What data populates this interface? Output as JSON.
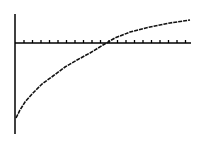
{
  "chart_data": {
    "type": "line",
    "title": "",
    "xlabel": "",
    "ylabel": "",
    "grid": false,
    "legend": null,
    "x_tick_count": 20,
    "series": [
      {
        "name": "curve",
        "points_px": [
          [
            16,
            118
          ],
          [
            20,
            110
          ],
          [
            25,
            102
          ],
          [
            33,
            93
          ],
          [
            42,
            84
          ],
          [
            53,
            76
          ],
          [
            65,
            67
          ],
          [
            77,
            60
          ],
          [
            90,
            53
          ],
          [
            103,
            45
          ],
          [
            115,
            38
          ],
          [
            130,
            32
          ],
          [
            150,
            27
          ],
          [
            170,
            23
          ],
          [
            190,
            20
          ]
        ]
      }
    ],
    "axes_px": {
      "y_axis": {
        "x": 15,
        "y1": 14,
        "y2": 134
      },
      "x_axis": {
        "y": 43,
        "x1": 15,
        "x2": 191
      },
      "tick_start": 24,
      "tick_spacing": 8.5,
      "tick_len": 3
    },
    "colors": {
      "axis": "#000000",
      "curve": "#111111",
      "background": "#ffffff"
    }
  }
}
